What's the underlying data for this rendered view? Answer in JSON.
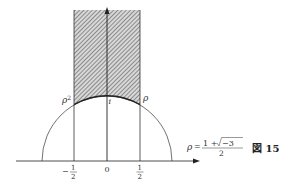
{
  "figure": {
    "caption": "図 15",
    "caption_prefix": "図",
    "caption_number": "15"
  },
  "formula": {
    "lhs": "ρ",
    "eq": "=",
    "numerator": "1 + √−3",
    "numerator_prefix": "1 +",
    "sqrt_content": "−3",
    "denominator": "2"
  },
  "points": {
    "rho_squared": "ρ²",
    "rho_squared_base": "ρ",
    "rho_squared_exp": "2",
    "i": "i",
    "rho": "ρ"
  },
  "axis_ticks": {
    "neg_half": {
      "sign": "−",
      "num": "1",
      "den": "2"
    },
    "zero": "0",
    "pos_half": {
      "num": "1",
      "den": "2"
    }
  },
  "colors": {
    "line": "#333333",
    "hatch_dark": "#555555",
    "hatch_light": "#cfcfcf"
  },
  "geometry": {
    "origin_x": 107,
    "axis_y": 161,
    "unit": 66,
    "strip": "|Re z| ≤ 1/2, |z| ≥ 1 (fundamental domain)"
  }
}
